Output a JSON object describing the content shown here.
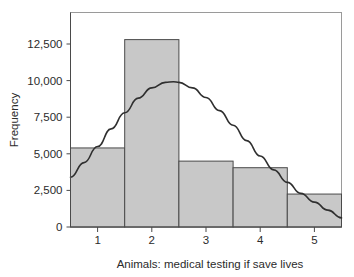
{
  "chart_data": {
    "type": "bar",
    "title": "",
    "subtitle": "",
    "xlabel": "Animals: medical testing if save lives",
    "ylabel": "Frequency",
    "categories": [
      "1",
      "2",
      "3",
      "4",
      "5"
    ],
    "values": [
      5400,
      12800,
      4500,
      4050,
      2250
    ],
    "bin_edges": [
      0.5,
      1.5,
      2.5,
      3.5,
      4.5,
      5.5
    ],
    "xlim": [
      0.5,
      5.5
    ],
    "ylim": [
      0,
      13700
    ],
    "xticks": [
      "1",
      "2",
      "3",
      "4",
      "5"
    ],
    "xtick_values": [
      1,
      2,
      3,
      4,
      5
    ],
    "yticks": [
      "0",
      "2,500",
      "5,000",
      "7,500",
      "10,000",
      "12,500"
    ],
    "ytick_values": [
      0,
      2500,
      5000,
      7500,
      10000,
      12500
    ],
    "grid": false,
    "legend": null,
    "legend_position": "none",
    "bar_fill_color": "#c8c8c8",
    "bar_edge_color": "#4a4a4a",
    "curve_color": "#2f2f2f",
    "frame_color": "#9a9a9a",
    "background_color": "#ffffff",
    "series": [
      {
        "name": "Frequency",
        "type": "bar",
        "values": [
          5400,
          12800,
          4500,
          4050,
          2250
        ]
      },
      {
        "name": "Normal curve",
        "type": "line",
        "x": [
          0.5,
          0.75,
          1.0,
          1.25,
          1.5,
          1.75,
          2.0,
          2.25,
          2.4,
          2.5,
          2.75,
          3.0,
          3.25,
          3.5,
          3.75,
          4.0,
          4.25,
          4.5,
          4.75,
          5.0,
          5.25,
          5.5
        ],
        "values": [
          3400,
          4400,
          5500,
          6700,
          7800,
          8800,
          9500,
          9880,
          9920,
          9880,
          9500,
          8850,
          7950,
          6950,
          5900,
          4850,
          3900,
          3050,
          2300,
          1700,
          1150,
          620
        ]
      }
    ]
  },
  "axes": {
    "y_axis_title": "Frequency",
    "x_axis_title": "Animals: medical testing if save lives"
  }
}
